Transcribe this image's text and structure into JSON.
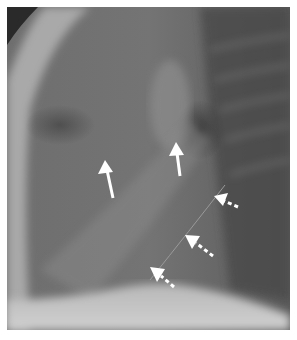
{
  "figure": {
    "annotations": [
      {
        "type": "solid-arrow",
        "label": ""
      },
      {
        "type": "solid-arrow",
        "label": ""
      },
      {
        "type": "dashed-arrow",
        "label": ""
      },
      {
        "type": "dashed-arrow",
        "label": ""
      },
      {
        "type": "dashed-arrow",
        "label": ""
      }
    ],
    "colors": {
      "background": "#ffffff",
      "arrow": "#ffffff"
    }
  }
}
